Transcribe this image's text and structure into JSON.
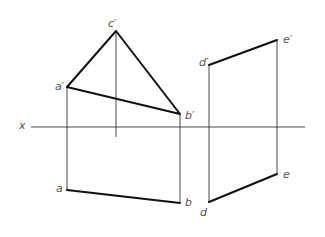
{
  "diagram": {
    "type": "orthographic-projection",
    "axis": {
      "label": "x",
      "y": 127,
      "x1": 31,
      "x2": 305
    },
    "points": {
      "a_prime": {
        "label": "a′",
        "x": 67,
        "y": 87
      },
      "b_prime": {
        "label": "b′",
        "x": 180,
        "y": 114
      },
      "c_prime": {
        "label": "c′",
        "x": 116,
        "y": 31
      },
      "d_prime": {
        "label": "d′",
        "x": 209,
        "y": 65
      },
      "e_prime": {
        "label": "e′",
        "x": 277,
        "y": 40
      },
      "a": {
        "label": "a",
        "x": 67,
        "y": 190
      },
      "b": {
        "label": "b",
        "x": 180,
        "y": 203
      },
      "d": {
        "label": "d",
        "x": 209,
        "y": 202
      },
      "e": {
        "label": "e",
        "x": 277,
        "y": 174
      }
    },
    "thick_segments": [
      [
        "a_prime",
        "b_prime"
      ],
      [
        "b_prime",
        "c_prime"
      ],
      [
        "c_prime",
        "a_prime"
      ],
      [
        "d_prime",
        "e_prime"
      ],
      [
        "a",
        "b"
      ],
      [
        "d",
        "e"
      ]
    ],
    "projection_lines": [
      [
        "a_prime",
        "a"
      ],
      [
        "b_prime",
        "b"
      ],
      [
        "d_prime",
        "d"
      ],
      [
        "e_prime",
        "e"
      ],
      [
        "c_prime",
        "c_end"
      ]
    ],
    "c_end": {
      "x": 116,
      "y": 137
    }
  }
}
